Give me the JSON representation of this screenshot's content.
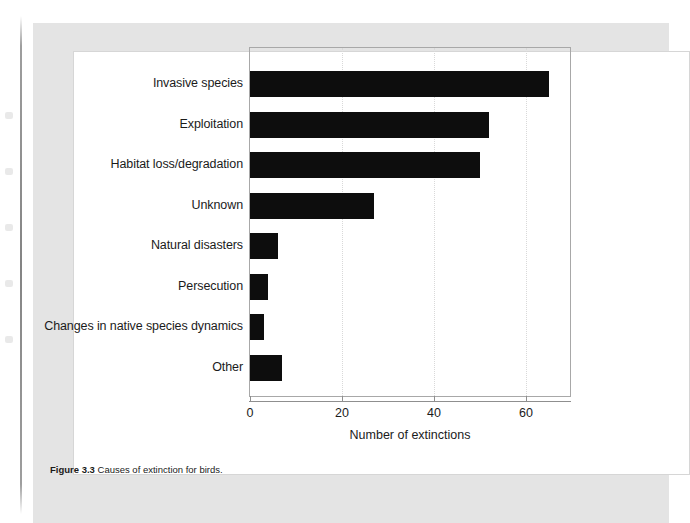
{
  "figure": {
    "caption_label": "Figure 3.3",
    "caption_text": "Causes of extinction for birds."
  },
  "chart_data": {
    "type": "bar",
    "orientation": "horizontal",
    "title": "",
    "xlabel": "Number of extinctions",
    "ylabel": "",
    "xlim": [
      0,
      70
    ],
    "ylim": [],
    "grid": "vertical-dotted",
    "legend": "none",
    "bar_color": "#0d0d0d",
    "xticks": [
      0,
      20,
      40,
      60
    ],
    "xtick_labels": [
      "0",
      "20",
      "40",
      "60"
    ],
    "categories": [
      "Invasive species",
      "Exploitation",
      "Habitat loss/degradation",
      "Unknown",
      "Natural disasters",
      "Persecution",
      "Changes in native species dynamics",
      "Other"
    ],
    "values": [
      65,
      52,
      50,
      27,
      6,
      4,
      3,
      7
    ]
  }
}
